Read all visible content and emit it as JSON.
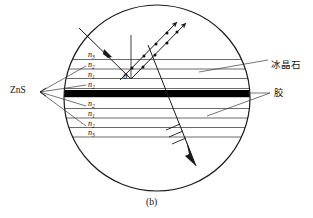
{
  "figure": {
    "caption": "(b)",
    "type": "optics-ray-diagram",
    "description_geometry": {
      "circle": {
        "cx": 157,
        "cy": 98,
        "r": 93
      },
      "black_band": {
        "y_top": 90,
        "y_bottom": 97
      }
    },
    "colors": {
      "stroke": "#1a1a1a",
      "layer_line": "#555555",
      "black_band": "#000000",
      "background": "#ffffff"
    }
  },
  "layers": [
    {
      "id": "layer-1",
      "label_n": "n",
      "label_sub": "3",
      "y": 55,
      "x": 88
    },
    {
      "id": "layer-2",
      "label_n": "n",
      "label_sub": "2",
      "y": 65,
      "x": 88
    },
    {
      "id": "layer-3",
      "label_n": "n",
      "label_sub": "1",
      "y": 74,
      "x": 88
    },
    {
      "id": "layer-4",
      "label_n": "n",
      "label_sub": "2",
      "y": 85,
      "x": 88
    },
    {
      "id": "layer-5",
      "label_n": "n",
      "label_sub": "2",
      "y": 104,
      "x": 88
    },
    {
      "id": "layer-6",
      "label_n": "n",
      "label_sub": "1",
      "y": 114,
      "x": 88
    },
    {
      "id": "layer-7",
      "label_n": "n",
      "label_sub": "2",
      "y": 123,
      "x": 88
    },
    {
      "id": "layer-8",
      "label_n": "n",
      "label_sub": "3",
      "y": 133,
      "x": 88
    }
  ],
  "annotations": {
    "zns": {
      "text": "ZnS",
      "x": 12,
      "y": 92
    },
    "cryolite": {
      "text": "冰晶石",
      "x": 272,
      "y": 66
    },
    "glue": {
      "text": "胶",
      "x": 275,
      "y": 97
    },
    "theta": {
      "text": "θ",
      "x": 123,
      "y": 76
    }
  },
  "rays": {
    "incident_label": "incident-ray",
    "reflected_label": "reflected-rays",
    "transmitted_label": "transmitted-ray",
    "normal_label": "normal-line"
  }
}
